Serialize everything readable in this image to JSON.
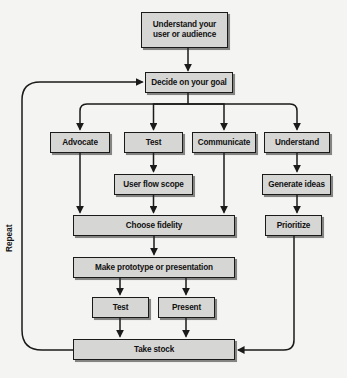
{
  "diagram": {
    "background_color": "#f4f4f2",
    "node_fill_color": "#d6d6d4",
    "node_border_color": "#1a1a1a",
    "edge_color": "#1a1a1a",
    "loop_label": "Repeat",
    "nodes": [
      {
        "id": "understand_user",
        "label": "Understand your\nuser or audience",
        "line1": "Understand your",
        "line2": "user or audience",
        "x": 141,
        "y": 12,
        "w": 87,
        "h": 36
      },
      {
        "id": "decide_goal",
        "label": "Decide on your goal",
        "x": 145,
        "y": 72,
        "w": 88,
        "h": 21
      },
      {
        "id": "advocate",
        "label": "Advocate",
        "x": 50,
        "y": 132,
        "w": 60,
        "h": 21
      },
      {
        "id": "test_branch",
        "label": "Test",
        "x": 124,
        "y": 132,
        "w": 59,
        "h": 21
      },
      {
        "id": "communicate",
        "label": "Communicate",
        "x": 192,
        "y": 132,
        "w": 64,
        "h": 21
      },
      {
        "id": "understand",
        "label": "Understand",
        "x": 264,
        "y": 132,
        "w": 66,
        "h": 21
      },
      {
        "id": "user_flow_scope",
        "label": "User flow scope",
        "x": 114,
        "y": 174,
        "w": 79,
        "h": 21
      },
      {
        "id": "generate_ideas",
        "label": "Generate ideas",
        "x": 262,
        "y": 174,
        "w": 69,
        "h": 21
      },
      {
        "id": "choose_fidelity",
        "label": "Choose fidelity",
        "x": 73,
        "y": 215,
        "w": 162,
        "h": 21
      },
      {
        "id": "prioritize",
        "label": "Prioritize",
        "x": 265,
        "y": 215,
        "w": 57,
        "h": 21
      },
      {
        "id": "make_prototype",
        "label": "Make prototype or presentation",
        "x": 73,
        "y": 257,
        "w": 162,
        "h": 21
      },
      {
        "id": "test_final",
        "label": "Test",
        "x": 92,
        "y": 297,
        "w": 57,
        "h": 21
      },
      {
        "id": "present",
        "label": "Present",
        "x": 158,
        "y": 297,
        "w": 57,
        "h": 21
      },
      {
        "id": "take_stock",
        "label": "Take stock",
        "x": 73,
        "y": 339,
        "w": 162,
        "h": 21
      }
    ],
    "edges": [
      {
        "from": "understand_user",
        "to": "decide_goal",
        "kind": "straight-down"
      },
      {
        "from": "decide_goal",
        "to": "advocate",
        "kind": "fan-out"
      },
      {
        "from": "decide_goal",
        "to": "test_branch",
        "kind": "fan-out"
      },
      {
        "from": "decide_goal",
        "to": "communicate",
        "kind": "fan-out"
      },
      {
        "from": "decide_goal",
        "to": "understand",
        "kind": "fan-out"
      },
      {
        "from": "advocate",
        "to": "choose_fidelity",
        "kind": "straight-down"
      },
      {
        "from": "test_branch",
        "to": "user_flow_scope",
        "kind": "straight-down"
      },
      {
        "from": "user_flow_scope",
        "to": "choose_fidelity",
        "kind": "straight-down"
      },
      {
        "from": "communicate",
        "to": "choose_fidelity",
        "kind": "straight-down"
      },
      {
        "from": "understand",
        "to": "generate_ideas",
        "kind": "straight-down"
      },
      {
        "from": "generate_ideas",
        "to": "prioritize",
        "kind": "straight-down"
      },
      {
        "from": "choose_fidelity",
        "to": "make_prototype",
        "kind": "straight-down"
      },
      {
        "from": "make_prototype",
        "to": "test_final",
        "kind": "straight-down"
      },
      {
        "from": "make_prototype",
        "to": "present",
        "kind": "straight-down"
      },
      {
        "from": "test_final",
        "to": "take_stock",
        "kind": "straight-down"
      },
      {
        "from": "present",
        "to": "take_stock",
        "kind": "straight-down"
      },
      {
        "from": "prioritize",
        "to": "take_stock",
        "kind": "curve-right-in"
      },
      {
        "from": "take_stock",
        "to": "decide_goal",
        "kind": "curve-left-loop",
        "label": "Repeat"
      }
    ]
  }
}
